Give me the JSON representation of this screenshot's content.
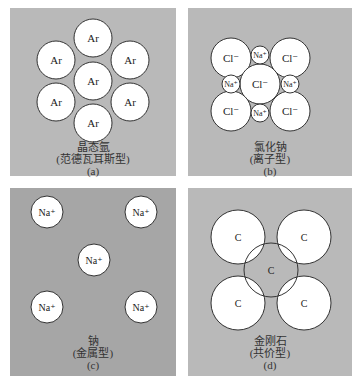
{
  "colors": {
    "panel_light": "#b9b9b9",
    "panel_dark": "#a6a6a6",
    "atom_fill": "#ffffff",
    "atom_stroke": "#333333"
  },
  "panels": [
    {
      "id": "a",
      "atom_label": "Ar",
      "title": "晶态氩",
      "subtitle": "(范德瓦耳斯型)",
      "tag": "(a)"
    },
    {
      "id": "b",
      "big_label": "Cl⁻",
      "small_label": "Na⁺",
      "title": "氯化钠",
      "subtitle": "(离子型)",
      "tag": "(b)"
    },
    {
      "id": "c",
      "atom_label": "Na⁺",
      "title": "钠",
      "subtitle": "(金属型)",
      "tag": "(c)"
    },
    {
      "id": "d",
      "atom_label": "C",
      "title": "金刚石",
      "subtitle": "(共价型)",
      "tag": "(d)"
    }
  ]
}
